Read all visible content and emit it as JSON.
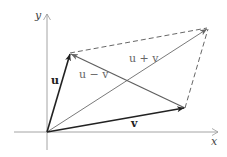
{
  "diagram": {
    "axes": {
      "x_label": "x",
      "y_label": "y"
    },
    "points": {
      "origin": [
        47,
        132
      ],
      "u_tip": [
        70,
        53
      ],
      "v_tip": [
        185,
        108
      ],
      "sum_tip": [
        208,
        28
      ]
    },
    "vectors": [
      {
        "name": "u",
        "label": "u",
        "style": "solid-bold",
        "color": "#222222"
      },
      {
        "name": "v",
        "label": "v",
        "style": "solid-bold",
        "color": "#222222"
      },
      {
        "name": "u_plus_v",
        "label": "u + v",
        "style": "solid",
        "color": "#7a7a7a"
      },
      {
        "name": "u_minus_v",
        "label": "u − v",
        "style": "solid",
        "color": "#6a6a6a"
      }
    ],
    "labels": {
      "u": "u",
      "v": "v",
      "u_plus_v": "u + v",
      "u_minus_v": "u − v",
      "x": "x",
      "y": "y"
    },
    "colors": {
      "axis": "#9a9a9a",
      "primary": "#222222",
      "secondary": "#7a7a7a",
      "dashed": "#555555"
    }
  }
}
